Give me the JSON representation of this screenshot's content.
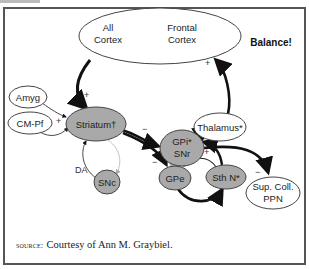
{
  "figure": {
    "title_annotation": "Balance!",
    "source_label": "source:",
    "source_text": "Courtesy of Ann M. Graybiel."
  },
  "nodes": {
    "cortex_all": {
      "line1": "All",
      "line2": "Cortex"
    },
    "cortex_frontal": {
      "line1": "Frontal",
      "line2": "Cortex"
    },
    "amyg": {
      "label": "Amyg"
    },
    "cmpf": {
      "label": "CM-Pf"
    },
    "striatum": {
      "label": "Striatum†"
    },
    "thalamus": {
      "label": "Thalamus*"
    },
    "gpi_snr": {
      "line1": "GPi*",
      "line2": "SNr"
    },
    "gpe": {
      "label": "GPe"
    },
    "sthn": {
      "label": "Sth N*"
    },
    "snc": {
      "label": "SNc"
    },
    "supcoll_ppn": {
      "line1": "Sup. Coll.",
      "line2": "PPN"
    }
  },
  "edges": [
    {
      "from": "All Cortex",
      "to": "Striatum",
      "sign": "+"
    },
    {
      "from": "Amyg",
      "to": "Striatum",
      "sign": "+"
    },
    {
      "from": "CM-Pf",
      "to": "Striatum",
      "sign": "+"
    },
    {
      "from": "SNc",
      "to": "Striatum",
      "sign": "DA"
    },
    {
      "from": "Striatum",
      "to": "SNc",
      "sign": ""
    },
    {
      "from": "Striatum",
      "to": "GPi/SNr",
      "sign": "−"
    },
    {
      "from": "Striatum",
      "to": "GPe",
      "sign": "−"
    },
    {
      "from": "GPi/SNr",
      "to": "Thalamus",
      "sign": "−"
    },
    {
      "from": "Thalamus",
      "to": "Frontal Cortex",
      "sign": "+"
    },
    {
      "from": "GPi/SNr",
      "to": "Sup. Coll./PPN",
      "sign": "−"
    },
    {
      "from": "GPe",
      "to": "GPi/SNr",
      "sign": ""
    },
    {
      "from": "Sth N",
      "to": "GPi/SNr",
      "sign": "+"
    },
    {
      "from": "Sth N",
      "to": "GPe",
      "sign": "+"
    },
    {
      "from": "GPe",
      "to": "Sth N",
      "sign": "−"
    }
  ],
  "signs": {
    "plus": "+",
    "minus": "−",
    "da": "DA"
  },
  "colors": {
    "gray_node_fill": "#a9a9a9",
    "node_stroke": "#444444",
    "arrow": "#111111",
    "light_arrow": "#aaaaaa",
    "frame": "#555555"
  }
}
